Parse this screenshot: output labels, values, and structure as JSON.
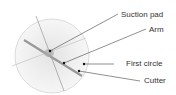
{
  "diagram": {
    "labels": {
      "suction_pad": "Suction pad",
      "arm": "Arm",
      "first_circle": "First circle",
      "cutter": "Cutter"
    },
    "colors": {
      "circle_fill": "#eeeeee",
      "line": "#555555",
      "arm": "#999999"
    }
  }
}
